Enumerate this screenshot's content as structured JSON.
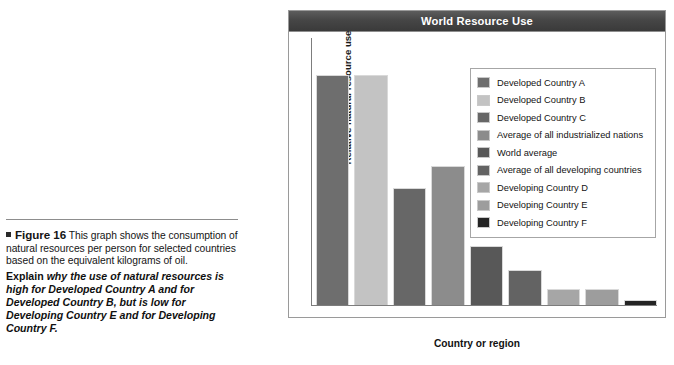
{
  "caption": {
    "figure_label": "Figure 16",
    "body_text": "This graph shows the consumption of natural resources per person for selected countries based on the equivalent kilograms of oil.",
    "explain_word": "Explain",
    "explain_text": " why the use of natural resources is high for Developed Country A and for Developed Country B, but is low for Developing Country E and for Developing Country F."
  },
  "chart_data": {
    "type": "bar",
    "title": "World Resource Use",
    "xlabel": "Country or region",
    "ylabel": "Relative natural resource use",
    "grid": false,
    "legend_position": "inside-top-right",
    "ylim": [
      0,
      100
    ],
    "categories": [
      "Developed Country A",
      "Developed Country B",
      "Developed Country C",
      "Average of all industrialized nations",
      "World average",
      "Average of all developing countries",
      "Developing Country D",
      "Developing Country E",
      "Developing Country F"
    ],
    "values": [
      86,
      86,
      44,
      52,
      22,
      13,
      6,
      6,
      2
    ],
    "colors": [
      "#6e6e6e",
      "#c3c3c3",
      "#676767",
      "#8c8c8c",
      "#585858",
      "#636363",
      "#a6a6a6",
      "#9d9d9d",
      "#242424"
    ]
  }
}
